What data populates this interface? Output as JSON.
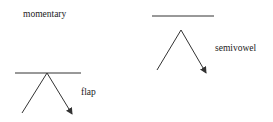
{
  "labels": {
    "momentary": "momentary",
    "semivowel": "semivowel",
    "flap": "flap"
  },
  "colors": {
    "line": "#333333",
    "text": "#222222",
    "background": "#ffffff"
  },
  "diagrams": [
    {
      "name": "semivowel",
      "baseline": {
        "x1": 152,
        "y1": 16,
        "x2": 214,
        "y2": 16
      },
      "apex": {
        "x": 181,
        "y": 30
      },
      "left_end": {
        "x": 157,
        "y": 70
      },
      "arrow_tip": {
        "x": 206,
        "y": 73
      }
    },
    {
      "name": "flap",
      "baseline": {
        "x1": 15,
        "y1": 73,
        "x2": 81,
        "y2": 73
      },
      "apex": {
        "x": 47,
        "y": 73
      },
      "left_end": {
        "x": 22,
        "y": 113
      },
      "arrow_tip": {
        "x": 72,
        "y": 114
      }
    }
  ]
}
